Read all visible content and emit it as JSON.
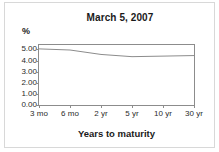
{
  "chart_data": {
    "type": "line",
    "title": "March 5, 2007",
    "xlabel": "Years to maturity",
    "ylabel": "%",
    "categories": [
      "3 mo",
      "6 mo",
      "2 yr",
      "5 yr",
      "10 yr",
      "30 yr"
    ],
    "values": [
      5.05,
      4.95,
      4.55,
      4.35,
      4.4,
      4.45
    ],
    "series": [
      {
        "name": "Yield",
        "values": [
          5.05,
          4.95,
          4.55,
          4.35,
          4.4,
          4.45
        ]
      }
    ],
    "ylim": [
      0.0,
      5.4
    ],
    "yticks": [
      0.0,
      1.0,
      2.0,
      3.0,
      4.0,
      5.0
    ],
    "ytick_labels": [
      "0.00",
      "1.00",
      "2.00",
      "3.00",
      "4.00",
      "5.00"
    ],
    "grid": false,
    "legend": false,
    "legend_position": "none",
    "line_color": "#8c8c8c",
    "axis_color": "#8c8c8c",
    "text_color": "#1a1a1a",
    "background_color": "#ffffff"
  }
}
